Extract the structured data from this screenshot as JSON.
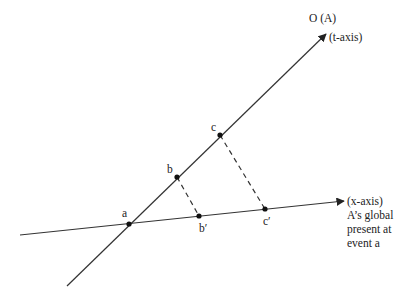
{
  "diagram": {
    "t_axis": {
      "label_top": "O (A)",
      "label": "(t-axis)",
      "start": [
        67,
        286
      ],
      "end": [
        326,
        34
      ]
    },
    "x_axis": {
      "label": "(x-axis)",
      "annotation_lines": [
        "A’s global",
        "present at",
        "event a"
      ],
      "start": [
        20,
        235
      ],
      "end": [
        344,
        201
      ]
    },
    "points": [
      {
        "id": "a",
        "label": "a",
        "x": 129,
        "y": 224
      },
      {
        "id": "b",
        "label": "b",
        "x": 177,
        "y": 177
      },
      {
        "id": "c",
        "label": "c",
        "x": 220,
        "y": 135
      },
      {
        "id": "b_prime",
        "label": "b′",
        "x": 199,
        "y": 216
      },
      {
        "id": "c_prime",
        "label": "c′",
        "x": 265,
        "y": 209
      }
    ],
    "projections": [
      {
        "from": "b",
        "to": "b_prime"
      },
      {
        "from": "c",
        "to": "c_prime"
      }
    ],
    "colors": {
      "line": "#333333",
      "point": "#111111",
      "text": "#222222"
    }
  }
}
